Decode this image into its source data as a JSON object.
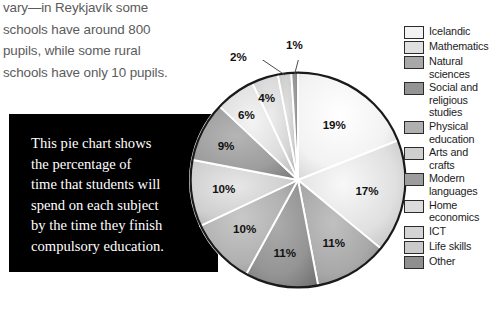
{
  "body_text": {
    "lines": [
      "vary—in Reykjavík some",
      "schools have around 800",
      "pupils, while some rural",
      "schools have only 10 pupils."
    ]
  },
  "caption_box": {
    "background": "#000000",
    "text_color": "#ffffff",
    "lines": [
      "This pie chart shows",
      "the percentage of",
      "time that students will",
      "spend on each subject",
      "by the time they finish",
      "compulsory education."
    ]
  },
  "legend": {
    "items": [
      {
        "label_lines": [
          "Icelandic"
        ],
        "color": "#f2f2f2"
      },
      {
        "label_lines": [
          "Mathematics"
        ],
        "color": "#e0e0e0"
      },
      {
        "label_lines": [
          "Natural",
          "sciences"
        ],
        "color": "#a8a8a8"
      },
      {
        "label_lines": [
          "Social and",
          "religious",
          "studies"
        ],
        "color": "#949494"
      },
      {
        "label_lines": [
          "Physical",
          "education"
        ],
        "color": "#b0b0b0"
      },
      {
        "label_lines": [
          "Arts and",
          "crafts"
        ],
        "color": "#cfcfcf"
      },
      {
        "label_lines": [
          "Modern",
          "languages"
        ],
        "color": "#9d9d9d"
      },
      {
        "label_lines": [
          "Home",
          "economics"
        ],
        "color": "#dcdcdc"
      },
      {
        "label_lines": [
          "ICT"
        ],
        "color": "#d4d4d4"
      },
      {
        "label_lines": [
          "Life skills"
        ],
        "color": "#cacaca"
      },
      {
        "label_lines": [
          "Other"
        ],
        "color": "#8f8f8f"
      }
    ]
  },
  "chart_data": {
    "type": "pie",
    "title": "",
    "unit": "%",
    "start_angle_deg": 0,
    "direction": "clockwise",
    "legend_position": "right",
    "grid": false,
    "categories": [
      "Icelandic",
      "Mathematics",
      "Natural sciences",
      "Social and religious studies",
      "Physical education",
      "Arts and crafts",
      "Modern languages",
      "Home economics",
      "ICT",
      "Life skills",
      "Other"
    ],
    "values": [
      19,
      17,
      11,
      11,
      10,
      10,
      9,
      6,
      4,
      2,
      1
    ],
    "labels": [
      "19%",
      "17%",
      "11%",
      "11%",
      "10%",
      "10%",
      "9%",
      "6%",
      "4%",
      "2%",
      "1%"
    ],
    "colors": [
      "#f2f2f2",
      "#e0e0e0",
      "#a8a8a8",
      "#949494",
      "#b0b0b0",
      "#cfcfcf",
      "#9d9d9d",
      "#dcdcdc",
      "#d4d4d4",
      "#cacaca",
      "#8f8f8f"
    ],
    "callout_labels": [
      "2%",
      "1%"
    ],
    "total": 100
  }
}
